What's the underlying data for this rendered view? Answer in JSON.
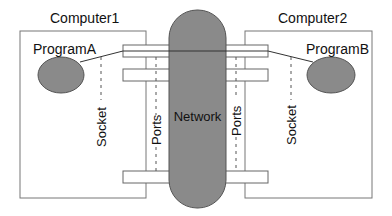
{
  "diagram": {
    "computers": [
      {
        "label": "Computer1",
        "program": "ProgramA",
        "socket_label": "Socket",
        "ports_label": "Ports"
      },
      {
        "label": "Computer2",
        "program": "ProgramB",
        "socket_label": "Socket",
        "ports_label": "Ports"
      }
    ],
    "network": {
      "label": "Network"
    },
    "colors": {
      "node_fill": "#8a8a8a",
      "stroke": "#555555",
      "box_stroke": "#777777",
      "background": "#ffffff"
    }
  }
}
